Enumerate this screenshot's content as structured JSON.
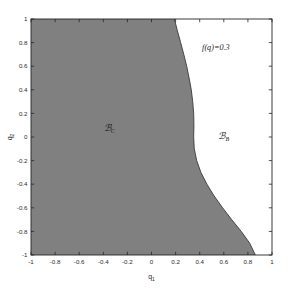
{
  "chart_data": {
    "type": "area",
    "title": "",
    "subtitle": "",
    "xlabel": "q",
    "xlabel_sub": "1",
    "ylabel": "q",
    "ylabel_sub": "2",
    "xlim": [
      -1,
      1
    ],
    "ylim": [
      -1,
      1
    ],
    "grid": false,
    "legend": "none",
    "xticks": [
      -1,
      -0.8,
      -0.6,
      -0.4,
      -0.2,
      0,
      0.2,
      0.4,
      0.6,
      0.8,
      1
    ],
    "xtick_labels": [
      "-1",
      "-0.8",
      "-0.6",
      "-0.4",
      "-0.2",
      "0",
      "0.2",
      "0.4",
      "0.6",
      "0.8",
      "1"
    ],
    "yticks": [
      -1,
      -0.8,
      -0.6,
      -0.4,
      -0.2,
      0,
      0.2,
      0.4,
      0.6,
      0.8,
      1
    ],
    "ytick_labels": [
      "-1",
      "-0.8",
      "-0.6",
      "-0.4",
      "-0.2",
      "0",
      "0.2",
      "0.4",
      "0.6",
      "0.8",
      "1"
    ],
    "shaded_region_color": "#808080",
    "unshaded_region_color": "#ffffff",
    "axis_line_color": "#262626",
    "boundary_curve_color": "#3a3a3a",
    "boundary_curve_label": "f(q)=0.3",
    "boundary_curve_points": [
      {
        "q1": 0.19,
        "q2": 1.0
      },
      {
        "q1": 0.215,
        "q2": 0.9
      },
      {
        "q1": 0.242,
        "q2": 0.8
      },
      {
        "q1": 0.268,
        "q2": 0.7
      },
      {
        "q1": 0.292,
        "q2": 0.6
      },
      {
        "q1": 0.312,
        "q2": 0.5
      },
      {
        "q1": 0.33,
        "q2": 0.4
      },
      {
        "q1": 0.342,
        "q2": 0.3
      },
      {
        "q1": 0.35,
        "q2": 0.2
      },
      {
        "q1": 0.352,
        "q2": 0.1
      },
      {
        "q1": 0.35,
        "q2": 0.0
      },
      {
        "q1": 0.355,
        "q2": -0.1
      },
      {
        "q1": 0.375,
        "q2": -0.2
      },
      {
        "q1": 0.41,
        "q2": -0.3
      },
      {
        "q1": 0.46,
        "q2": -0.4
      },
      {
        "q1": 0.52,
        "q2": -0.5
      },
      {
        "q1": 0.59,
        "q2": -0.6
      },
      {
        "q1": 0.665,
        "q2": -0.7
      },
      {
        "q1": 0.745,
        "q2": -0.8
      },
      {
        "q1": 0.815,
        "q2": -0.9
      },
      {
        "q1": 0.862,
        "q2": -1.0
      }
    ],
    "annotations": [
      {
        "name": "contour-value-label",
        "text": "f(q)=0.3",
        "q1": 0.42,
        "q2": 0.74
      }
    ],
    "region_labels": [
      {
        "name": "region-bc",
        "symbol": "ℬ",
        "subscript": "C",
        "q1": -0.35,
        "q2": 0.055,
        "region": "shaded"
      },
      {
        "name": "region-bb",
        "symbol": "ℬ",
        "subscript": "B",
        "q1": 0.6,
        "q2": -0.015,
        "region": "unshaded"
      }
    ]
  }
}
